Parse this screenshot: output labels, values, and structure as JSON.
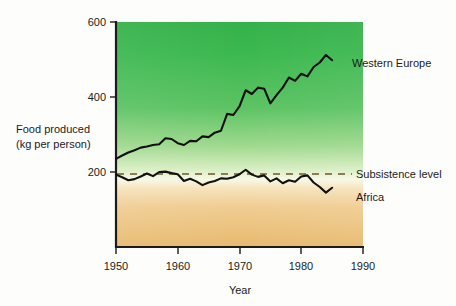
{
  "chart_data": {
    "type": "line",
    "title": "",
    "xlabel": "Year",
    "ylabel": "Food produced (kg per person)",
    "ylabel_line1": "Food produced",
    "ylabel_line2": "(kg per person)",
    "xlim": [
      1950,
      1990
    ],
    "ylim": [
      0,
      600
    ],
    "xticks": [
      1950,
      1960,
      1970,
      1980,
      1990
    ],
    "yticks": [
      200,
      400,
      600
    ],
    "grid": false,
    "legend_position": "right-inline",
    "annotations": [
      {
        "name": "subsistence-level",
        "label": "Subsistence level",
        "type": "hline",
        "value": 200,
        "style": "dashed"
      }
    ],
    "x": [
      1950,
      1951,
      1952,
      1953,
      1954,
      1955,
      1956,
      1957,
      1958,
      1959,
      1960,
      1961,
      1962,
      1963,
      1964,
      1965,
      1966,
      1967,
      1968,
      1969,
      1970,
      1971,
      1972,
      1973,
      1974,
      1975,
      1976,
      1977,
      1978,
      1979,
      1980,
      1981,
      1982,
      1983,
      1984,
      1985
    ],
    "series": [
      {
        "name": "Western Europe",
        "color": "#111111",
        "values": [
          235,
          244,
          252,
          258,
          265,
          268,
          272,
          274,
          290,
          288,
          277,
          272,
          283,
          282,
          295,
          293,
          305,
          310,
          355,
          352,
          375,
          418,
          408,
          425,
          422,
          383,
          405,
          425,
          452,
          443,
          462,
          455,
          480,
          492,
          512,
          498
        ]
      },
      {
        "name": "Africa",
        "color": "#111111",
        "values": [
          193,
          186,
          178,
          181,
          188,
          196,
          189,
          200,
          201,
          197,
          194,
          176,
          182,
          175,
          165,
          172,
          176,
          183,
          182,
          186,
          194,
          206,
          193,
          187,
          191,
          175,
          183,
          170,
          178,
          174,
          188,
          191,
          172,
          160,
          145,
          158
        ]
      }
    ]
  },
  "labels": {
    "western_europe": "Western Europe",
    "africa": "Africa",
    "subsistence_level": "Subsistence level"
  },
  "colors": {
    "top_green": "#3bb54a",
    "mid_pale": "#fbfcf2",
    "bottom_tan": "#eec07a",
    "line": "#111111",
    "axis": "#1b1b1b",
    "dashed": "#6b5a2a"
  }
}
